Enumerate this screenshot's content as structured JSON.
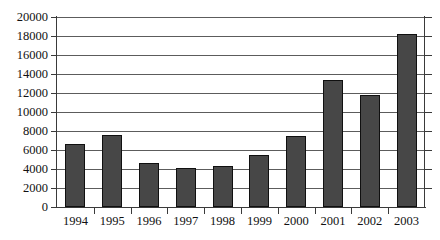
{
  "chart_data": {
    "type": "bar",
    "title": "",
    "subtitle": "",
    "xlabel": "",
    "ylabel": "",
    "categories": [
      "1994",
      "1995",
      "1996",
      "1997",
      "1998",
      "1999",
      "2000",
      "2001",
      "2002",
      "2003"
    ],
    "values": [
      6600,
      7600,
      4600,
      4100,
      4300,
      5500,
      7500,
      13400,
      11800,
      18200
    ],
    "series": [
      {
        "name": "",
        "values": [
          6600,
          7600,
          4600,
          4100,
          4300,
          5500,
          7500,
          13400,
          11800,
          18200
        ]
      }
    ],
    "ylim": [
      0,
      20000
    ],
    "ytick_values": [
      0,
      2000,
      4000,
      6000,
      8000,
      10000,
      12000,
      14000,
      16000,
      18000,
      20000
    ],
    "ytick_labels": [
      "0",
      "2000",
      "4000",
      "6000",
      "8000",
      "10000",
      "12000",
      "14000",
      "16000",
      "18000",
      "20000"
    ],
    "grid": true,
    "grid_axis": "y",
    "legend": false,
    "legend_position": "none",
    "bar_color": "#474747",
    "bar_edge_color": "#101010",
    "grid_color": "#5c5c5c",
    "axis_color": "#3a3a3a",
    "background_color": "#ffffff",
    "annotations": []
  }
}
